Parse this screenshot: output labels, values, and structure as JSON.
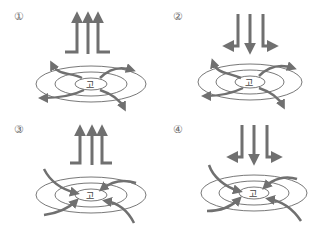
{
  "panels": [
    {
      "number": "①",
      "center_label": "고",
      "vertical_flow": "upward",
      "surface_flow": "outward"
    },
    {
      "number": "②",
      "center_label": "고",
      "vertical_flow": "downward",
      "surface_flow": "outward"
    },
    {
      "number": "③",
      "center_label": "고",
      "vertical_flow": "upward",
      "surface_flow": "inward"
    },
    {
      "number": "④",
      "center_label": "고",
      "vertical_flow": "downward",
      "surface_flow": "inward"
    }
  ],
  "colors": {
    "arrow": "#707070",
    "isobar": "#555555"
  }
}
